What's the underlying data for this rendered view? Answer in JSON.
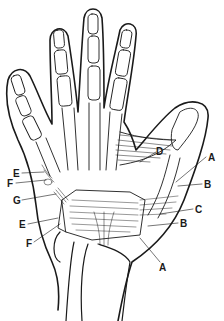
{
  "figure": {
    "labels": [
      {
        "id": "A1",
        "text": "A",
        "x": 208,
        "y": 153
      },
      {
        "id": "B1",
        "text": "B",
        "x": 204,
        "y": 180
      },
      {
        "id": "C1",
        "text": "C",
        "x": 195,
        "y": 205
      },
      {
        "id": "B2",
        "text": "B",
        "x": 180,
        "y": 219
      },
      {
        "id": "A2",
        "text": "A",
        "x": 159,
        "y": 263
      },
      {
        "id": "D1",
        "text": "D",
        "x": 156,
        "y": 147
      },
      {
        "id": "E1",
        "text": "E",
        "x": 13,
        "y": 169
      },
      {
        "id": "F1",
        "text": "F",
        "x": 7,
        "y": 179
      },
      {
        "id": "G1",
        "text": "G",
        "x": 13,
        "y": 196
      },
      {
        "id": "E2",
        "text": "E",
        "x": 19,
        "y": 220
      },
      {
        "id": "F2",
        "text": "F",
        "x": 26,
        "y": 239
      }
    ]
  },
  "colors": {
    "line": "#1a1a1a",
    "background": "#ffffff"
  }
}
